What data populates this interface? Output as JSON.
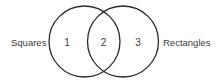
{
  "diagram": {
    "type": "venn",
    "sets": [
      {
        "name": "Squares",
        "label": "Squares",
        "cx": 84.5,
        "cy": 41.5,
        "r": 35.5
      },
      {
        "name": "Rectangles",
        "label": "Rectangles",
        "cx": 123,
        "cy": 41.5,
        "r": 35.5
      }
    ],
    "regions": [
      {
        "id": "1",
        "label": "1",
        "description": "Squares only"
      },
      {
        "id": "2",
        "label": "2",
        "description": "Squares and Rectangles"
      },
      {
        "id": "3",
        "label": "3",
        "description": "Rectangles only"
      }
    ],
    "colors": {
      "stroke": "#2a2a2a",
      "text": "#3a3a3a",
      "background": "#ffffff"
    }
  }
}
